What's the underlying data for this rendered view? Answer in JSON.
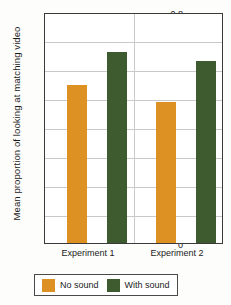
{
  "chart_data": {
    "type": "bar",
    "title": "",
    "xlabel": "",
    "ylabel": "Mean proportion of looking at matching video",
    "categories": [
      "Experiment 1",
      "Experiment 2"
    ],
    "series": [
      {
        "name": "No sound",
        "color": "#dd9123",
        "values": [
          0.555,
          0.495
        ]
      },
      {
        "name": "With sound",
        "color": "#3d5b2e",
        "values": [
          0.67,
          0.64
        ]
      }
    ],
    "ylim": [
      0,
      0.8
    ],
    "ytick_labels": [
      "0.8",
      "0.7",
      "0.6",
      "0.5",
      "0.4",
      "0.3",
      "0.2",
      "0.1",
      "0"
    ],
    "ytick_values": [
      0.8,
      0.7,
      0.6,
      0.5,
      0.4,
      0.3,
      0.2,
      0.1,
      0
    ],
    "grid": "horizontal",
    "legend_position": "bottom"
  },
  "legend": {
    "entries": [
      {
        "label": "No sound",
        "color": "#dd9123"
      },
      {
        "label": "With sound",
        "color": "#3d5b2e"
      }
    ]
  },
  "axis": {
    "y_title": "Mean proportion of looking at matching video",
    "tick_0": "0.8",
    "tick_1": "0.7",
    "tick_2": "0.6",
    "tick_3": "0.5",
    "tick_4": "0.4",
    "tick_5": "0.3",
    "tick_6": "0.2",
    "tick_7": "0.1",
    "tick_8": "0"
  },
  "categories": {
    "cat_0": "Experiment 1",
    "cat_1": "Experiment 2"
  }
}
